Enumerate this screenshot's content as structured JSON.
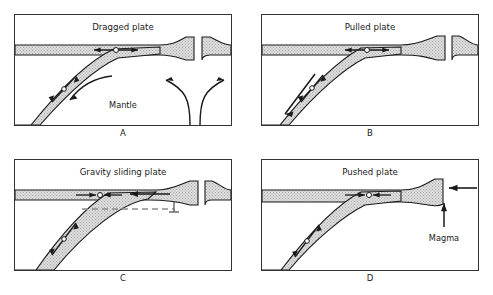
{
  "figure": {
    "title_present": false,
    "background_color": "#ffffff",
    "panel_border_color": "#333333",
    "plate_fill_color": "#d8d8d8",
    "plate_outline_color": "#1a1a1a",
    "arrow_color": "#111111",
    "dashed_line_color": "#8c8c8c"
  },
  "panels": [
    {
      "id": "A",
      "letter": "A",
      "title": "Dragged plate",
      "labels": [
        "Mantle"
      ],
      "motion_symbol": "double-arrow-with-circle",
      "features": [
        "subducting-slab",
        "horizontal-plate",
        "mid-ocean-ridge",
        "mantle-convection-arrows",
        "slab-up-down-arrow"
      ]
    },
    {
      "id": "B",
      "letter": "B",
      "title": "Pulled plate",
      "labels": [],
      "motion_symbol": "double-arrow-with-circle",
      "features": [
        "subducting-slab",
        "horizontal-plate",
        "mid-ocean-ridge",
        "slab-pull-down-arrow"
      ]
    },
    {
      "id": "C",
      "letter": "C",
      "title": "Gravity sliding plate",
      "labels": [],
      "motion_symbol": "converging-arrows-with-circle",
      "features": [
        "subducting-slab",
        "horizontal-plate",
        "mid-ocean-ridge",
        "dashed-reference-line",
        "elevation-tick-mark",
        "leftward-sliding-arrow",
        "slab-up-arrow"
      ]
    },
    {
      "id": "D",
      "letter": "D",
      "title": "Pushed plate",
      "labels": [
        "Magma"
      ],
      "motion_symbol": "converging-arrows-with-circle",
      "features": [
        "subducting-slab",
        "horizontal-plate",
        "ridge-push-arrow",
        "magma-upward-arrow",
        "slab-up-arrow"
      ]
    }
  ]
}
